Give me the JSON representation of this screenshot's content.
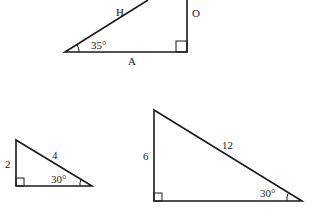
{
  "diagram": {
    "triangles": [
      {
        "id": "reference-triangle",
        "angle": "35°",
        "hypotenuse_label": "H",
        "opposite_label": "O",
        "adjacent_label": "A",
        "right_angle": true
      },
      {
        "id": "small-triangle",
        "angle": "30°",
        "hypotenuse_label": "4",
        "opposite_label": "2",
        "right_angle": true
      },
      {
        "id": "large-triangle",
        "angle": "30°",
        "hypotenuse_label": "12",
        "opposite_label": "6",
        "right_angle": true
      }
    ]
  }
}
